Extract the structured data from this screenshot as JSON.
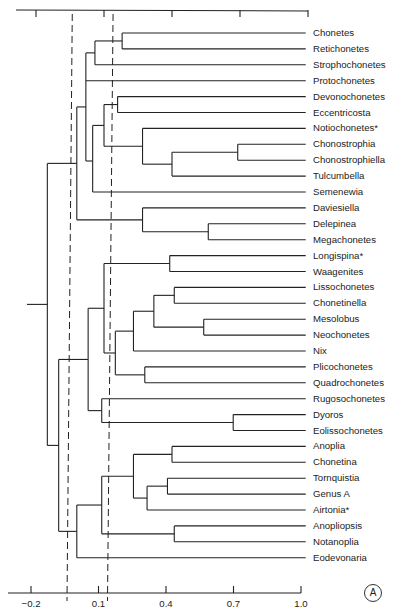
{
  "figure": {
    "panel_label": "A",
    "bottom_axis_ticks": [
      "-0.2",
      "0.1",
      "0.4",
      "0.7",
      "1.0"
    ]
  },
  "chart_data": {
    "type": "dendrogram",
    "title": "",
    "xlabel": "",
    "ylabel": "",
    "xlim": [
      -0.2,
      1.0
    ],
    "x_ticks": [
      -0.2,
      0.1,
      0.4,
      0.7,
      1.0
    ],
    "axes": [
      "top (unlabeled ticks)",
      "bottom (labeled ticks)"
    ],
    "reference_lines": [
      {
        "style": "dashed",
        "value": -0.04
      },
      {
        "style": "dashed",
        "value": 0.14
      }
    ],
    "leaves": [
      "Chonetes",
      "Retichonetes",
      "Strophochonetes",
      "Protochonetes",
      "Devonochonetes",
      "Eccentricosta",
      "Notiochonetes*",
      "Chonostrophia",
      "Chonostrophiella",
      "Tulcumbella",
      "Semenewia",
      "Daviesiella",
      "Delepinea",
      "Megachonetes",
      "Longispina*",
      "Waagenites",
      "Lissochonetes",
      "Chonetinella",
      "Mesolobus",
      "Neochonetes",
      "Nix",
      "Plicochonetes",
      "Quadrochonetes",
      "Rugosochonetes",
      "Dyoros",
      "Eolissochonetes",
      "Anoplia",
      "Chonetina",
      "Tornquistia",
      "Genus  A",
      "Airtonia*",
      "Anopliopsis",
      "Notanoplia",
      "Eodevonaria"
    ],
    "leaf_value": 0.99,
    "nodes": {
      "n1": {
        "value": 0.18,
        "children": [
          "L0",
          "L1"
        ]
      },
      "n2": {
        "value": 0.06,
        "children": [
          "n1",
          "L2"
        ]
      },
      "n3": {
        "value": 0.16,
        "children": [
          "L4",
          "L5"
        ]
      },
      "n4": {
        "value": 0.69,
        "children": [
          "L7",
          "L8"
        ]
      },
      "n5": {
        "value": 0.4,
        "children": [
          "n4",
          "L9"
        ]
      },
      "n6": {
        "value": 0.27,
        "children": [
          "L6",
          "n5"
        ]
      },
      "n7": {
        "value": 0.1,
        "children": [
          "n3",
          "n6"
        ]
      },
      "n8": {
        "value": 0.05,
        "children": [
          "n7",
          "L10"
        ],
        "branch_y": 161
      },
      "n9": {
        "value": 0.02,
        "children": [
          "n2",
          "L3",
          "n8"
        ]
      },
      "n10": {
        "value": 0.56,
        "children": [
          "L12",
          "L13"
        ]
      },
      "n11": {
        "value": 0.27,
        "children": [
          "L11",
          "n10"
        ]
      },
      "n12": {
        "value": -0.02,
        "children": [
          "n9",
          "n11"
        ]
      },
      "n13": {
        "value": 0.39,
        "children": [
          "L14",
          "L15"
        ]
      },
      "n14": {
        "value": 0.41,
        "children": [
          "L16",
          "L17"
        ]
      },
      "n15": {
        "value": 0.54,
        "children": [
          "L18",
          "L19"
        ]
      },
      "n16": {
        "value": 0.32,
        "children": [
          "n14",
          "n15"
        ]
      },
      "n17": {
        "value": 0.23,
        "children": [
          "n16",
          "L20"
        ]
      },
      "n18": {
        "value": 0.28,
        "children": [
          "L21",
          "L22"
        ]
      },
      "n19": {
        "value": 0.15,
        "children": [
          "n17",
          "n18"
        ]
      },
      "n20": {
        "value": 0.1,
        "children": [
          "n13",
          "n19"
        ]
      },
      "n21": {
        "value": 0.67,
        "children": [
          "L24",
          "L25"
        ]
      },
      "n22": {
        "value": 0.09,
        "children": [
          "L23",
          "n21"
        ]
      },
      "n23": {
        "value": 0.03,
        "children": [
          "n20",
          "n22"
        ]
      },
      "n24": {
        "value": 0.4,
        "children": [
          "L26",
          "L27"
        ]
      },
      "n25": {
        "value": 0.38,
        "children": [
          "L28",
          "L29"
        ]
      },
      "n26": {
        "value": 0.29,
        "children": [
          "n25",
          "L30"
        ]
      },
      "n27": {
        "value": 0.23,
        "children": [
          "n24",
          "n26"
        ]
      },
      "n28": {
        "value": 0.41,
        "children": [
          "L31",
          "L32"
        ]
      },
      "n29": {
        "value": 0.09,
        "children": [
          "n27",
          "n28"
        ]
      },
      "n30": {
        "value": -0.02,
        "children": [
          "n29",
          "L33"
        ]
      },
      "n31": {
        "value": -0.1,
        "children": [
          "n23",
          "n30"
        ]
      },
      "root": {
        "value": -0.15,
        "children": [
          "n12",
          "n31"
        ],
        "stub_to": -0.24
      }
    },
    "root": "root"
  }
}
